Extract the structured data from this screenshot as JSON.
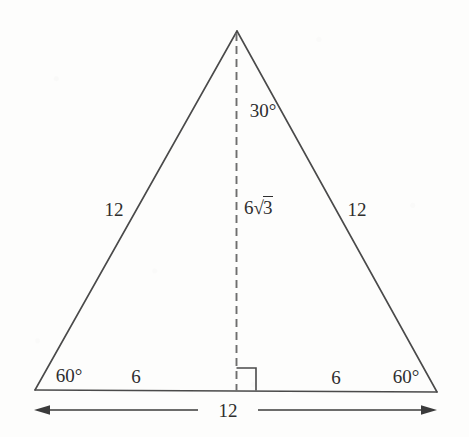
{
  "figure": {
    "type": "geometry-diagram",
    "shape": "equilateral-triangle-with-altitude",
    "background_color": "#fdfdfc",
    "stroke_color": "#4a4a4a",
    "text_color": "#2e2e2e",
    "geometry": {
      "apex": [
        237,
        31
      ],
      "base_left": [
        35,
        390
      ],
      "base_right": [
        437,
        392
      ],
      "altitude_foot": [
        236,
        391
      ],
      "dimension_arrow_y": 410,
      "dimension_arrow_left_x": 34,
      "dimension_arrow_right_x": 437
    },
    "labels": {
      "apex_angle": "30°",
      "altitude": {
        "coefficient": "6",
        "radical_sign": "√",
        "radicand": "3",
        "full": "6√3"
      },
      "left_side": "12",
      "right_side": "12",
      "left_base_angle": "60°",
      "right_base_angle": "60°",
      "left_half_base": "6",
      "right_half_base": "6",
      "base_dimension": "12"
    },
    "markers": {
      "right_angle_square": "right-angle-marker",
      "altitude_line_style": "dashed"
    }
  }
}
